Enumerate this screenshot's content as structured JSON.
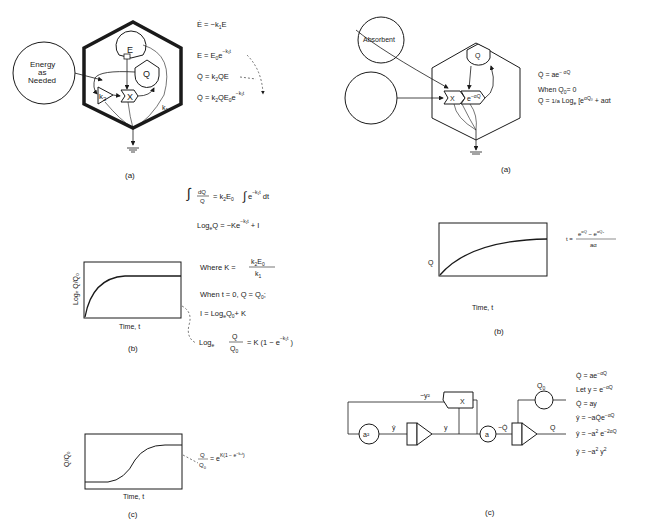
{
  "left": {
    "a": {
      "caption": "(a)",
      "source_label_line1": "Energy",
      "source_label_line2": "as",
      "source_label_line3": "Needed",
      "tank_E": "E",
      "tank_Q": "Q",
      "gain_label": "k",
      "gain_sub": "2",
      "multiplier_label": "X",
      "drain_label": "k",
      "drain_sub": "1",
      "equations": [
        "Ė = −k₁E",
        "E = E₀e",
        "Q̇ = k₂QE",
        "Q̇ = k₂QE₀e"
      ],
      "eq2_exp": "−k₁t",
      "eq4_exp": "−k₁t"
    },
    "derivation": [
      "∫ dQ/Q = k₂E₀∫e^(−k₁t) dt",
      "LogₑQ = −Ke^(−k₁t) + I",
      "Where K = k₂E₀ / k₁",
      "When t = 0, Q = Q₀;",
      "I = LogₑQ₀ + K",
      "Logₑ Q/Q₀ = K(1 − e^(−k₁t))"
    ],
    "b": {
      "caption": "(b)",
      "ylabel": "Logₑ Q/Q₀",
      "xlabel": "Time, t"
    },
    "c": {
      "caption": "(c)",
      "ylabel": "Q/Q₀",
      "xlabel": "Time, t",
      "equation": "Q/Q₀ = e^K(1 − e^(−k₁t))"
    }
  },
  "right": {
    "a": {
      "caption": "(a)",
      "source_label": "Absorbent",
      "tank_Q": "Q",
      "multiplier_label": "X",
      "work_label": "e^−αQ",
      "equations": [
        "Q̇ = ae^(−αQ)",
        "When Q₀ = 0",
        "Q = (1/a) Logₑ [e^(αQ₀) + aαt]"
      ]
    },
    "b": {
      "caption": "(b)",
      "ylabel": "Q",
      "xlabel": "Time, t",
      "equation": "t = (e^(αQ) − e^(αQ₀)) / aα"
    },
    "c": {
      "caption": "(c)",
      "labels": {
        "neg_y_sq": "−y²",
        "mult": "X",
        "a_sq": "a²",
        "y_dot": "ẏ",
        "y": "y",
        "a": "a",
        "neg_q_dot": "−Q̇",
        "q0": "Q₀",
        "q": "Q"
      },
      "equations": [
        "Q̇ = ae^(−αQ)",
        "Let y = e^(−αQ)",
        "Q̇ = ay",
        "ẏ = −aQ̇e^(−αQ)",
        "ẏ = −a²e^(−2αQ)",
        "ẏ = −a²y²"
      ]
    }
  }
}
